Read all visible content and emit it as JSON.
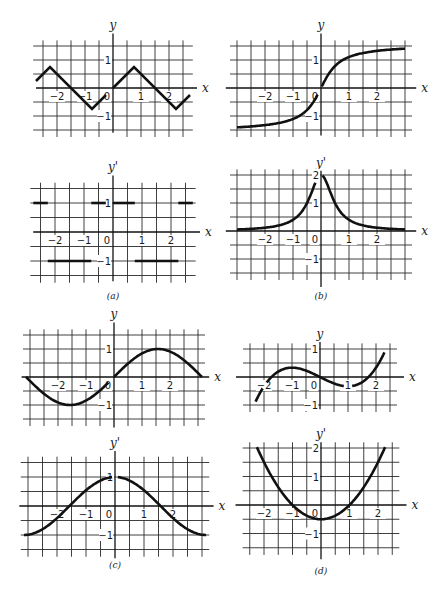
{
  "figure": {
    "panels": [
      "a",
      "b",
      "c",
      "d"
    ],
    "captions": {
      "a": "(a)",
      "b": "(b)",
      "c": "(c)",
      "d": "(d)"
    }
  },
  "chart_data": [
    {
      "id": "a-top",
      "panel": "(a)",
      "type": "line",
      "title": "",
      "xlabel": "x",
      "ylabel": "y",
      "function": "triangle wave, slope ±1, amplitude 0.75, period 3",
      "x": [
        -2.75,
        -2.25,
        -0.75,
        -0.25,
        0,
        0.75,
        2.25,
        2.75
      ],
      "y": [
        0.25,
        0.75,
        -0.75,
        -0.25,
        0,
        0.75,
        -0.75,
        -0.25
      ],
      "segments": [
        [
          [
            -2.75,
            0.25
          ],
          [
            -2.25,
            0.75
          ],
          [
            -0.75,
            -0.75
          ],
          [
            -0.25,
            -0.25
          ]
        ],
        [
          [
            0,
            0
          ],
          [
            0.75,
            0.75
          ],
          [
            2.25,
            -0.75
          ],
          [
            2.75,
            -0.25
          ]
        ]
      ],
      "xticks": [
        "-2",
        "-1",
        "0",
        "1",
        "2"
      ],
      "yticks": [
        "1",
        "-1"
      ],
      "xlim": [
        -3.5,
        3
      ],
      "ylim": [
        -1.5,
        1.5
      ],
      "grid": true
    },
    {
      "id": "a-bottom",
      "panel": "(a)",
      "type": "line",
      "title": "",
      "xlabel": "x",
      "ylabel": "y'",
      "function": "derivative of triangle wave: step function ±1",
      "segments": [
        [
          [
            -2.75,
            1
          ],
          [
            -2.25,
            1
          ]
        ],
        [
          [
            -2.25,
            -1
          ],
          [
            -0.75,
            -1
          ]
        ],
        [
          [
            -0.75,
            1
          ],
          [
            -0.25,
            1
          ]
        ],
        [
          [
            0,
            1
          ],
          [
            0.75,
            1
          ]
        ],
        [
          [
            0.75,
            -1
          ],
          [
            2.25,
            -1
          ]
        ],
        [
          [
            2.25,
            1
          ],
          [
            2.75,
            1
          ]
        ]
      ],
      "xticks": [
        "-2",
        "-1",
        "0",
        "1",
        "2"
      ],
      "yticks": [
        "1",
        "-1"
      ],
      "xlim": [
        -3.5,
        3
      ],
      "ylim": [
        -1.5,
        1.5
      ],
      "grid": true
    },
    {
      "id": "b-top",
      "panel": "(b)",
      "type": "line",
      "title": "",
      "xlabel": "x",
      "ylabel": "y",
      "function": "y = arctan(2x)",
      "x": [
        -3,
        -2,
        -1,
        -0.5,
        0,
        0.5,
        1,
        2,
        3
      ],
      "y": [
        -1.41,
        -1.33,
        -1.11,
        -0.79,
        0,
        0.79,
        1.11,
        1.33,
        1.41
      ],
      "xticks": [
        "-2",
        "-1",
        "0",
        "1",
        "2"
      ],
      "yticks": [
        "1",
        "-1"
      ],
      "xlim": [
        -3,
        3
      ],
      "ylim": [
        -1.5,
        1.5
      ],
      "grid": true
    },
    {
      "id": "b-bottom",
      "panel": "(b)",
      "type": "line",
      "title": "",
      "xlabel": "x",
      "ylabel": "y'",
      "function": "y' = 2 / (1 + 4x^2)",
      "x": [
        -3,
        -2,
        -1,
        -0.5,
        0,
        0.5,
        1,
        2,
        3
      ],
      "y": [
        0.05,
        0.12,
        0.4,
        1.0,
        2.0,
        1.0,
        0.4,
        0.12,
        0.05
      ],
      "xticks": [
        "-2",
        "-1",
        "0",
        "1",
        "2"
      ],
      "yticks": [
        "2",
        "1",
        "-1"
      ],
      "xlim": [
        -3,
        3
      ],
      "ylim": [
        -1.5,
        2
      ],
      "grid": true
    },
    {
      "id": "c-top",
      "panel": "(c)",
      "type": "line",
      "title": "",
      "xlabel": "x",
      "ylabel": "y",
      "function": "y = sin x, -π ≤ x ≤ π",
      "x": [
        -3.14,
        -1.57,
        0,
        1.57,
        3.14
      ],
      "y": [
        0,
        -1,
        0,
        1,
        0
      ],
      "xticks": [
        "-2",
        "-1",
        "0",
        "1",
        "2"
      ],
      "yticks": [
        "1",
        "-1"
      ],
      "xlim": [
        -3.14,
        3.14
      ],
      "ylim": [
        -1.5,
        1.5
      ],
      "grid": true
    },
    {
      "id": "c-bottom",
      "panel": "(c)",
      "type": "line",
      "title": "",
      "xlabel": "x",
      "ylabel": "y'",
      "function": "y' = cos x, -π ≤ x ≤ π",
      "x": [
        -3.14,
        -1.57,
        0,
        1.57,
        3.14
      ],
      "y": [
        -1,
        0,
        1,
        0,
        -1
      ],
      "xticks": [
        "-2",
        "-1",
        "0",
        "1",
        "2"
      ],
      "yticks": [
        "1",
        "-1"
      ],
      "xlim": [
        -3.14,
        3.14
      ],
      "ylim": [
        -1.5,
        1.5
      ],
      "grid": true
    },
    {
      "id": "d-top",
      "panel": "(d)",
      "type": "line",
      "title": "",
      "xlabel": "x",
      "ylabel": "y",
      "function": "y = x^3/6 - x/2",
      "x": [
        -2.3,
        -2,
        -1,
        0,
        1,
        2,
        2.3
      ],
      "y": [
        -0.88,
        -0.33,
        0.33,
        0,
        -0.33,
        0.33,
        0.88
      ],
      "xticks": [
        "-2",
        "-1",
        "0",
        "1",
        "2"
      ],
      "yticks": [
        "1",
        "-1"
      ],
      "xlim": [
        -2.8,
        2.8
      ],
      "ylim": [
        -1,
        1
      ],
      "grid": true
    },
    {
      "id": "d-bottom",
      "panel": "(d)",
      "type": "line",
      "title": "",
      "xlabel": "x",
      "ylabel": "y'",
      "function": "y' = x^2/2 - 1/2",
      "x": [
        -2.25,
        -2,
        -1,
        0,
        1,
        2,
        2.25
      ],
      "y": [
        2.03,
        1.5,
        0,
        -0.5,
        0,
        1.5,
        2.03
      ],
      "xticks": [
        "-2",
        "-1",
        "0",
        "1",
        "2"
      ],
      "yticks": [
        "2",
        "1",
        "-1"
      ],
      "xlim": [
        -2.8,
        2.8
      ],
      "ylim": [
        -1.5,
        2.2
      ],
      "grid": true
    }
  ],
  "labels": {
    "y": "y",
    "yp": "y'",
    "x": "x",
    "ticks": {
      "m2": "−2",
      "m1": "−1",
      "zero": "0",
      "p1": "1",
      "p2": "2"
    }
  }
}
